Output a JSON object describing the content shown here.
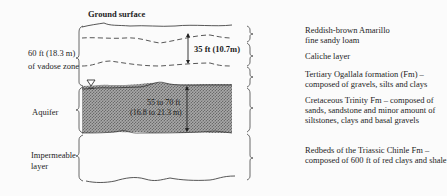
{
  "diagram": {
    "title": "Ground surface",
    "left_labels": {
      "vadose_line1": "60 ft (18.3 m)",
      "vadose_line2": "of vadose zone",
      "aquifer": "Aquifer",
      "impermeable_line1": "Impermeable",
      "impermeable_line2": "layer"
    },
    "measurements": {
      "caliche_thickness": "35 ft (10.7m)",
      "aquifer_thickness_ft": "55 to 70 ft",
      "aquifer_thickness_m": "(16.8 to 21.3 m)"
    },
    "right_labels": {
      "soil_line1": "Reddish-brown Amarillo",
      "soil_line2": "fine sandy loam",
      "caliche": "Caliche layer",
      "ogallala_line1": "Tertiary Ogallala formation (Fm) –",
      "ogallala_line2": "composed of gravels, silts and clays",
      "trinity_line1": "Cretaceous Trinity Fm – composed of",
      "trinity_line2": "sands, sandstone and minor amount of",
      "trinity_line3": "siltstones, clays and basal gravels",
      "chinle_line1": "Redbeds of the Triassic Chinle Fm –",
      "chinle_line2": "composed of 600 ft of red clays and shale"
    },
    "symbols": {
      "water_table": "water-table-triangle"
    },
    "colors": {
      "aquifer_fill": "#8a8a8a",
      "line": "#333333",
      "background": "#fbfbfb"
    }
  }
}
